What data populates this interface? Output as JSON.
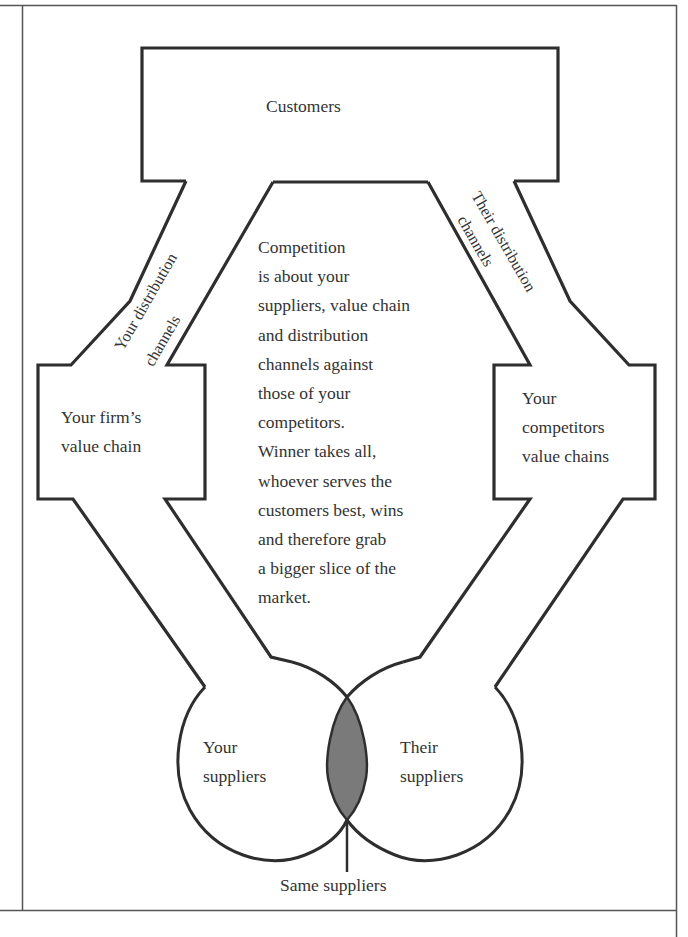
{
  "diagram": {
    "title": "",
    "colors": {
      "stroke": "#2e2e2e",
      "frame": "#555555",
      "overlap_fill": "#7a7a7a",
      "text": "#333333",
      "background": "#ffffff"
    },
    "nodes": {
      "customers": "Customers",
      "your_distribution": "Your distribution",
      "your_distribution_2": "channels",
      "their_distribution": "Their distribution",
      "their_distribution_2": "channels",
      "your_value_chain": "Your firm’s\nvalue chain",
      "competitor_value_chain": "Your\ncompetitors\nvalue chains",
      "your_suppliers": "Your\nsuppliers",
      "their_suppliers": "Their\nsuppliers",
      "same_suppliers": "Same suppliers"
    },
    "center_text": "Competition\nis about your\nsuppliers, value chain\nand distribution\nchannels against\nthose of your\ncompetitors.\nWinner takes all,\nwhoever serves the\ncustomers best, wins\nand therefore grab\na bigger slice of the\nmarket.",
    "edges": [
      {
        "from": "your_suppliers",
        "to": "your_value_chain"
      },
      {
        "from": "your_value_chain",
        "to": "customers",
        "via": "your_distribution_channels"
      },
      {
        "from": "their_suppliers",
        "to": "competitor_value_chain"
      },
      {
        "from": "competitor_value_chain",
        "to": "customers",
        "via": "their_distribution_channels"
      },
      {
        "from": "same_suppliers",
        "to": "overlap_of_suppliers"
      }
    ]
  }
}
